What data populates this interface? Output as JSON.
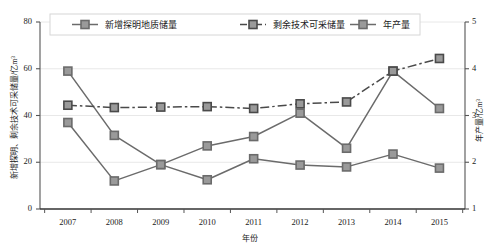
{
  "chart_data": {
    "type": "line",
    "title": "",
    "xlabel": "年份",
    "ylabel": "新增探明、剩余技术可采储量/亿m³",
    "ylabel_right": "年产量/亿m³",
    "categories": [
      "2007",
      "2008",
      "2009",
      "2010",
      "2011",
      "2012",
      "2013",
      "2014",
      "2015"
    ],
    "ylim": [
      0,
      80
    ],
    "yticks": [
      "0",
      "20",
      "40",
      "60",
      "80"
    ],
    "ylim_right": [
      1,
      5
    ],
    "yticks_right": [
      "1",
      "2",
      "3",
      "4",
      "5"
    ],
    "grid": true,
    "legend_position": "top-inside",
    "series": [
      {
        "name": "新增探明地质储量",
        "axis": "left",
        "style": "solid",
        "color": "#6b6b6b",
        "marker": "square",
        "values": [
          59,
          31.5,
          19,
          27,
          31,
          41,
          26,
          59,
          43
        ]
      },
      {
        "name": "剩余技术可采储量",
        "axis": "right",
        "style": "dash-dot",
        "color": "#4a4a4a",
        "marker": "square",
        "values": [
          3.22,
          3.17,
          3.18,
          3.19,
          3.15,
          3.25,
          3.29,
          3.95,
          4.22
        ]
      },
      {
        "name": "年产量",
        "axis": "left",
        "style": "solid",
        "color": "#6b6b6b",
        "marker": "square",
        "values": [
          37,
          12,
          19,
          12.5,
          21.5,
          18.8,
          18,
          23.5,
          17.5
        ]
      }
    ]
  }
}
